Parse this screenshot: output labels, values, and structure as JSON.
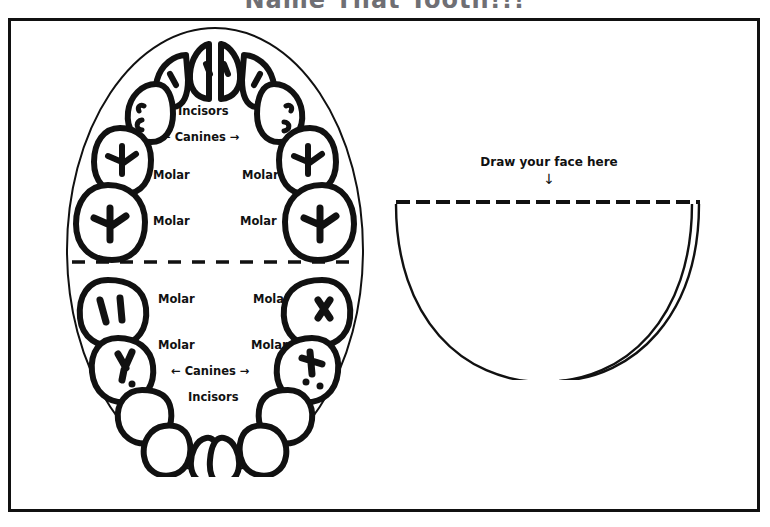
{
  "worksheet": {
    "title": "Name That Tooth!!!",
    "title_color": "#6f6f74",
    "border_color": "#111111",
    "ink_color": "#111111",
    "background": "#ffffff"
  },
  "mouth_diagram": {
    "name": "mouth-arch-diagram",
    "upper": {
      "incisors_label": "Incisors",
      "canines_label": "← Canines →",
      "molar_labels": [
        {
          "id": "upper-left-molar-1",
          "text": "Molar",
          "x": 95,
          "y": 150
        },
        {
          "id": "upper-left-molar-2",
          "text": "Molar",
          "x": 95,
          "y": 196
        },
        {
          "id": "upper-right-molar-1",
          "text": "Molar",
          "x": 185,
          "y": 150
        },
        {
          "id": "upper-right-molar-2",
          "text": "Molar",
          "x": 183,
          "y": 196
        }
      ],
      "incisors_pos": {
        "x": 118,
        "y": 88
      },
      "canines_pos": {
        "x": 106,
        "y": 113
      }
    },
    "lower": {
      "incisors_label": "Incisors",
      "canines_label": "← Canines →",
      "molar_labels": [
        {
          "id": "lower-left-molar-1",
          "text": "Molar",
          "x": 100,
          "y": 272
        },
        {
          "id": "lower-left-molar-2",
          "text": "Molar",
          "x": 100,
          "y": 320
        },
        {
          "id": "lower-right-molar-1",
          "text": "Molar",
          "x": 196,
          "y": 272
        },
        {
          "id": "lower-right-molar-2",
          "text": "Molar",
          "x": 194,
          "y": 320
        }
      ],
      "canines_pos": {
        "x": 114,
        "y": 347
      },
      "incisors_pos": {
        "x": 130,
        "y": 372
      }
    },
    "divider": "dashed"
  },
  "face_panel": {
    "name": "draw-your-face-panel",
    "instruction": "Draw your face here",
    "arrow": "↓",
    "shape": "half-ellipse-bowl"
  }
}
